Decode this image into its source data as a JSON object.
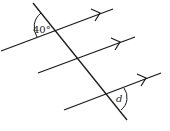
{
  "diagram": {
    "angle_labels": {
      "top": "40°",
      "bottom": "d"
    },
    "colors": {
      "line": "#1a1a1a",
      "background": "#ffffff"
    }
  }
}
